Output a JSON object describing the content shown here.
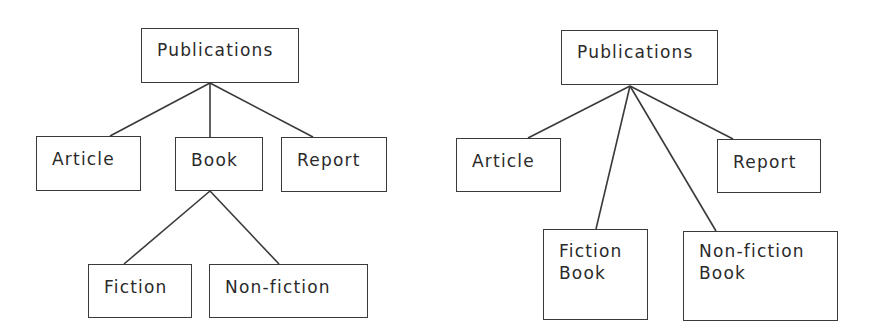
{
  "diagrams": [
    {
      "name": "single-level-with-book-subtypes",
      "root": {
        "label": "Publications"
      },
      "children": [
        {
          "label": "Article"
        },
        {
          "label": "Book",
          "children": [
            {
              "label": "Fiction"
            },
            {
              "label": "Non-fiction"
            }
          ]
        },
        {
          "label": "Report"
        }
      ]
    },
    {
      "name": "flattened-hierarchy",
      "root": {
        "label": "Publications"
      },
      "children": [
        {
          "label": "Article"
        },
        {
          "lines": [
            "Fiction",
            "Book"
          ]
        },
        {
          "lines": [
            "Non-fiction",
            "Book"
          ]
        },
        {
          "label": "Report"
        }
      ]
    }
  ],
  "colors": {
    "stroke": "#3a3a3a",
    "text": "#2a2a2a",
    "background": "#ffffff"
  }
}
